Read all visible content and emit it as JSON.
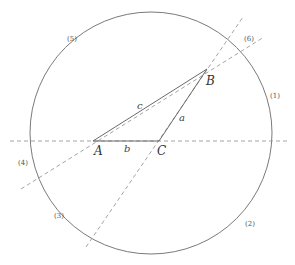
{
  "diagram": {
    "type": "geometry",
    "circle": {
      "cx": 151,
      "cy": 133,
      "r": 121,
      "stroke": "#7a7a7a"
    },
    "points": {
      "A": {
        "label": "A",
        "x": 93,
        "y": 141
      },
      "B": {
        "label": "B",
        "x": 207,
        "y": 69
      },
      "C": {
        "label": "C",
        "x": 159,
        "y": 141
      }
    },
    "sides": {
      "a": {
        "label": "a",
        "from": "C",
        "to": "B"
      },
      "b": {
        "label": "b",
        "from": "A",
        "to": "C"
      },
      "c": {
        "label": "c",
        "from": "A",
        "to": "B"
      }
    },
    "extension_lines": [
      {
        "name": "line-AC-extended",
        "x1": 10,
        "y1": 141,
        "x2": 290,
        "y2": 141
      },
      {
        "name": "line-AB-extended",
        "x1": 21,
        "y1": 189,
        "x2": 264,
        "y2": 37
      },
      {
        "name": "line-CB-extended",
        "x1": 86,
        "y1": 247,
        "x2": 243,
        "y2": 17
      }
    ],
    "regions": [
      {
        "id": 1,
        "label": "(1)"
      },
      {
        "id": 2,
        "label": "(2)"
      },
      {
        "id": 3,
        "label": "(3)"
      },
      {
        "id": 4,
        "label": "(4)"
      },
      {
        "id": 5,
        "label": "(5)"
      },
      {
        "id": 6,
        "label": "(6)"
      }
    ]
  }
}
